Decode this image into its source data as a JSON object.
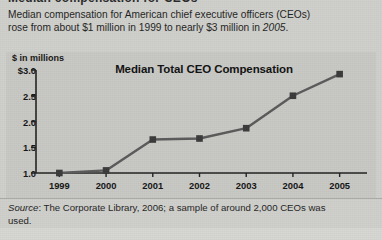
{
  "clipped_heading": "Median compensation for CEOs",
  "intro": {
    "line1": "Median compensation for American chief executive officers (CEOs)",
    "line2_a": "rose from about $1 million in 1999 to nearly $3 million in ",
    "line2_italic": "2005",
    "line2_b": "."
  },
  "chart_panel": {
    "axis_caption": "$ in millions",
    "title": "Median Total CEO Compensation"
  },
  "footer": {
    "source_label": "Source",
    "text_a": ": The Corporate Library, 2006; a sample of around 2,000 CEOs was",
    "text_b": "used."
  },
  "colors": {
    "background": "#cfcfcb",
    "panel": "#c8c8c4",
    "line": "#5a5a5a",
    "marker": "#3a3a3a",
    "axis": "#222222",
    "text": "#1a1a1a"
  },
  "chart_data": {
    "type": "line",
    "title": "Median Total CEO Compensation",
    "xlabel": "",
    "ylabel": "$ in millions",
    "categories": [
      "1999",
      "2000",
      "2001",
      "2002",
      "2003",
      "2004",
      "2005"
    ],
    "x": [
      1999,
      2000,
      2001,
      2002,
      2003,
      2004,
      2005
    ],
    "values": [
      1.0,
      1.05,
      1.65,
      1.67,
      1.87,
      2.5,
      2.92
    ],
    "series": [
      {
        "name": "Median Total CEO Compensation",
        "values": [
          1.0,
          1.05,
          1.65,
          1.67,
          1.87,
          2.5,
          2.92
        ]
      }
    ],
    "ylim": [
      1.0,
      3.0
    ],
    "yticks": [
      1.0,
      1.5,
      2.0,
      2.5,
      3.0
    ],
    "ytick_labels": [
      "1.0",
      "1.5",
      "2.0",
      "2.5",
      "$3.0"
    ],
    "grid": false,
    "legend": false,
    "marker": "square",
    "units": "millions of US dollars"
  }
}
